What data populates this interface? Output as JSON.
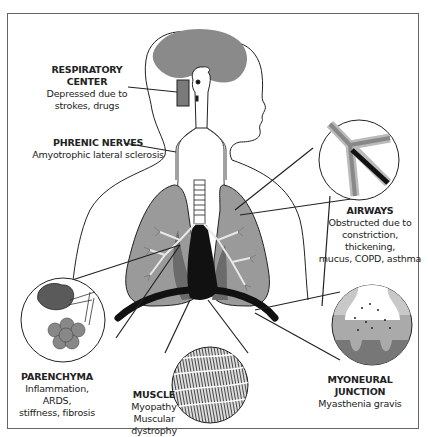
{
  "diagram": {
    "colors": {
      "brain": "#8a8a8a",
      "lung": "#9a9a9a",
      "lung_dark": "#6b6b6b",
      "heart": "#111111",
      "outline": "#222222",
      "background": "#ffffff",
      "frame": "#666666"
    },
    "labels": [
      {
        "id": "respiratory-center",
        "title": "RESPIRATORY CENTER",
        "lines": [
          "Depressed due to",
          "strokes, drugs"
        ]
      },
      {
        "id": "phrenic-nerves",
        "title": "PHRENIC NERVES",
        "lines": [
          "Amyotrophic lateral sclerosis"
        ]
      },
      {
        "id": "airways",
        "title": "AIRWAYS",
        "lines": [
          "Obstructed due to",
          "constriction, thickening,",
          "mucus, COPD, asthma"
        ]
      },
      {
        "id": "parenchyma",
        "title": "PARENCHYMA",
        "lines": [
          "Inflammation, ARDS,",
          "stiffness, fibrosis"
        ]
      },
      {
        "id": "muscle",
        "title": "MUSCLE",
        "lines": [
          "Myopathy",
          "Muscular dystrophy"
        ]
      },
      {
        "id": "myoneural-junction",
        "title": "MYONEURAL JUNCTION",
        "lines": [
          "Myasthenia gravis"
        ]
      }
    ],
    "insets": [
      {
        "id": "airways-inset",
        "depicts": "bronchus-branch-narrowed"
      },
      {
        "id": "parenchyma-inset",
        "depicts": "alveoli-cluster"
      },
      {
        "id": "muscle-inset",
        "depicts": "striated-muscle-fibers"
      },
      {
        "id": "myoneural-junction-inset",
        "depicts": "synapse-with-receptors"
      }
    ]
  }
}
